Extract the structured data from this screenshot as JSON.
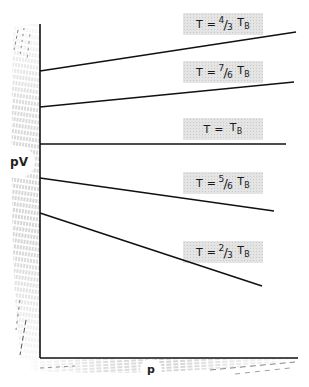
{
  "diagram": {
    "type": "pV vs p isotherms (Boyle temperature)",
    "y_axis_label": "pV",
    "x_axis_label": "p",
    "reference_temperature_symbol": "T_B",
    "isotherms": [
      {
        "id": "t-4-3",
        "label_prefix": "T =",
        "num": "4",
        "den": "3",
        "label_suffix": "T",
        "sub": "B",
        "slope": "positive",
        "start": [
          40,
          71
        ],
        "end": [
          296,
          32
        ]
      },
      {
        "id": "t-7-6",
        "label_prefix": "T =",
        "num": "7",
        "den": "6",
        "label_suffix": "T",
        "sub": "B",
        "slope": "positive",
        "start": [
          40,
          107
        ],
        "end": [
          294,
          82
        ]
      },
      {
        "id": "t-1",
        "label_prefix": "T =",
        "num": "",
        "den": "",
        "label_suffix": "T",
        "sub": "B",
        "slope": "zero",
        "start": [
          40,
          144
        ],
        "end": [
          286,
          144
        ]
      },
      {
        "id": "t-5-6",
        "label_prefix": "T =",
        "num": "5",
        "den": "6",
        "label_suffix": "T",
        "sub": "B",
        "slope": "negative",
        "start": [
          40,
          178
        ],
        "end": [
          274,
          211
        ]
      },
      {
        "id": "t-2-3",
        "label_prefix": "T =",
        "num": "2",
        "den": "3",
        "label_suffix": "T",
        "sub": "B",
        "slope": "negative",
        "start": [
          40,
          213
        ],
        "end": [
          262,
          286
        ]
      }
    ],
    "colors": {
      "line": "#111111",
      "label_fill": "#e4e4e4",
      "axis_shading": "#8a8a8a"
    }
  }
}
